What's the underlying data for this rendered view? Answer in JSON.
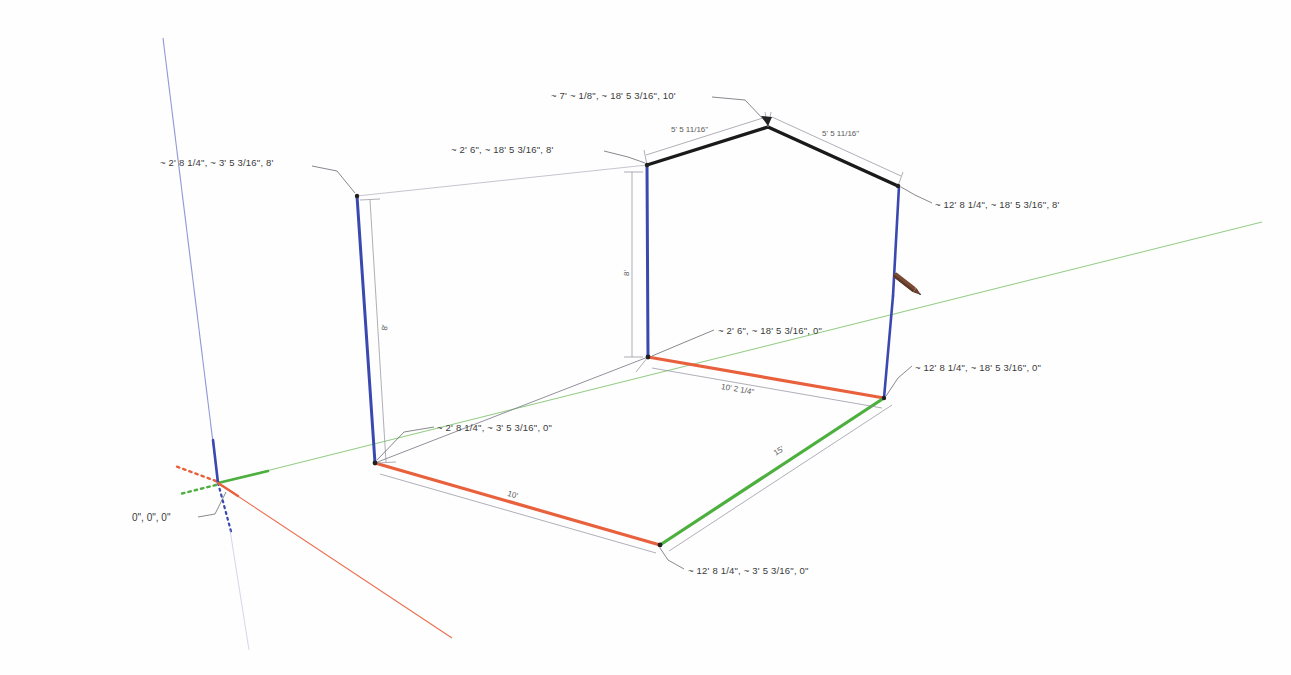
{
  "app": {
    "name": "SketchUp 3D Modeling Viewport",
    "background_color": "#ffffff"
  },
  "axes": {
    "origin_label": "0\", 0\", 0\"",
    "red_axis_color": "#e8603c",
    "green_axis_color": "#4caf3e",
    "blue_axis_color": "#3a49b0",
    "red_axis_name": "red-axis",
    "green_axis_name": "green-axis",
    "blue_axis_name": "blue-axis"
  },
  "cursor": {
    "tool": "pencil-cursor",
    "color": "#6b4030"
  },
  "coordinate_tooltips": [
    {
      "id": "left-wall-top",
      "text": "~ 2' 8 1/4\", ~ 3' 5 3/16\", 8'",
      "x": 160,
      "y": 157
    },
    {
      "id": "ridge-apex",
      "text": "~ 7' ~ 1/8\", ~ 18' 5 3/16\", 10'",
      "x": 551,
      "y": 90
    },
    {
      "id": "back-wall-top",
      "text": "~ 2' 6\", ~ 18' 5 3/16\", 8'",
      "x": 451,
      "y": 144
    },
    {
      "id": "right-wall-top",
      "text": "~ 12' 8 1/4\", ~ 18' 5 3/16\", 8'",
      "x": 935,
      "y": 199
    },
    {
      "id": "back-wall-base",
      "text": "~ 2' 6\", ~ 18' 5 3/16\", 0\"",
      "x": 718,
      "y": 325
    },
    {
      "id": "right-floor-corner",
      "text": "~ 12' 8 1/4\", ~ 18' 5 3/16\", 0\"",
      "x": 915,
      "y": 362
    },
    {
      "id": "left-floor-corner",
      "text": "~ 2' 8 1/4\", ~ 3' 5 3/16\", 0\"",
      "x": 437,
      "y": 422
    },
    {
      "id": "front-floor-corner",
      "text": "~ 12' 8 1/4\", ~ 3' 5 3/16\", 0\"",
      "x": 688,
      "y": 565
    }
  ],
  "dimensions": [
    {
      "id": "roof-left-slope",
      "text": "5' 5 11/16\"",
      "x": 671,
      "y": 125,
      "rotate": 0
    },
    {
      "id": "roof-right-slope",
      "text": "5' 5 11/16\"",
      "x": 822,
      "y": 129,
      "rotate": 0
    },
    {
      "id": "left-wall-height",
      "text": "8'",
      "x": 380,
      "y": 330,
      "rotate": -90
    },
    {
      "id": "back-wall-height",
      "text": "8'",
      "x": 622,
      "y": 276,
      "rotate": -90
    },
    {
      "id": "floor-front-edge",
      "text": "10'",
      "x": 509,
      "y": 489,
      "rotate": 9
    },
    {
      "id": "floor-back-edge",
      "text": "10' 2 1/4\"",
      "x": 722,
      "y": 382,
      "rotate": 9
    },
    {
      "id": "floor-side-edge",
      "text": "15'",
      "x": 772,
      "y": 450,
      "rotate": -36
    }
  ],
  "geometry": {
    "wall_edge_color": "#3a49b0",
    "roof_edge_color": "#1a1a1a",
    "floor_red_color": "#e8603c",
    "floor_green_color": "#4caf3e",
    "guide_line_color": "#9a9a9a",
    "thin_edge_color": "#8a8a98"
  }
}
